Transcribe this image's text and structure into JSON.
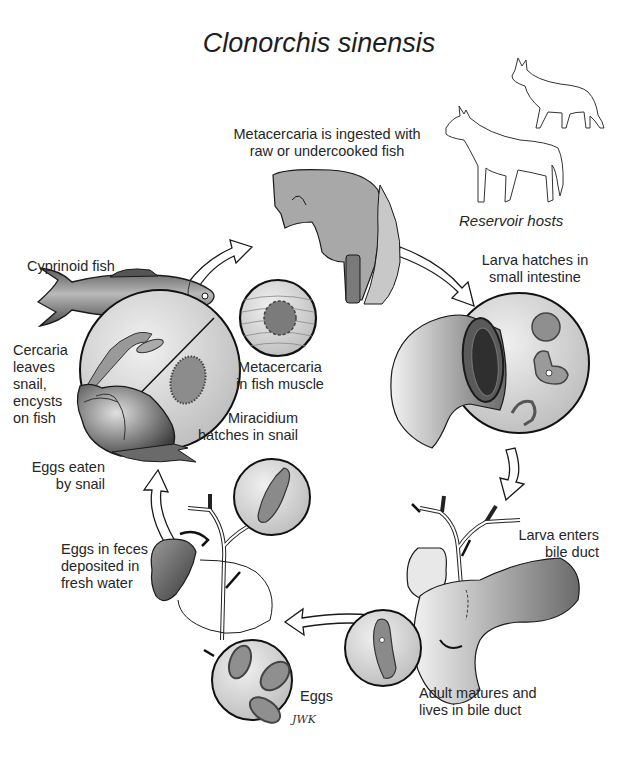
{
  "title": "Clonorchis sinensis",
  "labels": {
    "ingestion": [
      "Metacercaria is ingested with",
      "raw or undercooked fish"
    ],
    "reservoir_hosts": "Reservoir hosts",
    "larva_hatches": [
      "Larva hatches in",
      "small intestine"
    ],
    "cyprinoid_fish": "Cyprinoid fish",
    "cercaria": [
      "Cercaria",
      "leaves",
      "snail,",
      "encysts",
      "on fish"
    ],
    "metacercaria_muscle": [
      "Metacercaria",
      "in fish muscle"
    ],
    "miracidium": [
      "Miracidium",
      "hatches in snail"
    ],
    "eggs_eaten": [
      "Eggs eaten",
      "by snail"
    ],
    "eggs_feces": [
      "Eggs in feces",
      "deposited in",
      "fresh water"
    ],
    "larva_enters": [
      "Larva enters",
      "bile duct"
    ],
    "adult_matures": [
      "Adult matures and",
      "lives in bile duct"
    ],
    "eggs": "Eggs",
    "signature": "JWK"
  },
  "icons": {
    "host_animals": [
      "cat-icon",
      "dog-icon"
    ],
    "stages": [
      "fish-icon",
      "snail-icon",
      "head-throat-icon",
      "intestine-icon",
      "bile-duct-icon",
      "liver-icon"
    ]
  },
  "colors": {
    "line": "#1a1a1a",
    "fill_gray": "#b5b5b5",
    "fill_light": "#d8d8d8",
    "fill_dark": "#6e6e6e",
    "arrow_fill": "#ffffff"
  }
}
